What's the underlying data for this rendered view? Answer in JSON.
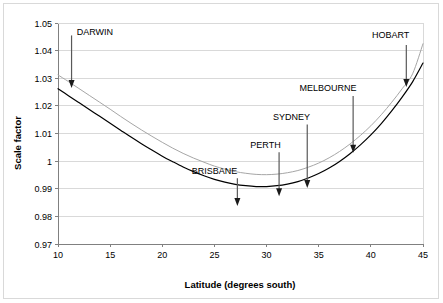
{
  "chart_data": {
    "type": "line",
    "title": "",
    "xlabel": "Latitude (degrees south)",
    "ylabel": "Scale factor",
    "xlim": [
      10,
      45
    ],
    "ylim": [
      0.97,
      1.05
    ],
    "xticks": [
      "10",
      "15",
      "20",
      "25",
      "30",
      "35",
      "40",
      "45"
    ],
    "xtick_values": [
      10,
      15,
      20,
      25,
      30,
      35,
      40,
      45
    ],
    "yticks": [
      "1.05",
      "1.04",
      "1.03",
      "1.02",
      "1.01",
      "1",
      "0.99",
      "0.98",
      "0.97"
    ],
    "ytick_values": [
      1.05,
      1.04,
      1.03,
      1.02,
      1.01,
      1.0,
      0.99,
      0.98,
      0.97
    ],
    "grid": "horizontal",
    "legend": "none",
    "series": [
      {
        "name": "upper-curve",
        "color": "#a6a6a6",
        "x": [
          10,
          11,
          12,
          13,
          14,
          15,
          16,
          17,
          18,
          19,
          20,
          21,
          22,
          23,
          24,
          25,
          26,
          27,
          28,
          29,
          30,
          31,
          32,
          33,
          34,
          35,
          36,
          37,
          38,
          39,
          40,
          41,
          42,
          43,
          44,
          45
        ],
        "values": [
          1.0312,
          1.0288,
          1.0263,
          1.0238,
          1.0213,
          1.0188,
          1.0162,
          1.0137,
          1.0113,
          1.009,
          1.0068,
          1.0047,
          1.0028,
          1.0011,
          0.9996,
          0.9982,
          0.9971,
          0.9962,
          0.9956,
          0.9952,
          0.9951,
          0.9953,
          0.9958,
          0.9966,
          0.9978,
          0.9993,
          1.0012,
          1.0035,
          1.0062,
          1.0093,
          1.0128,
          1.0168,
          1.0213,
          1.0262,
          1.0316,
          1.0425
        ]
      },
      {
        "name": "lower-curve",
        "color": "#000000",
        "x": [
          10,
          11,
          12,
          13,
          14,
          15,
          16,
          17,
          18,
          19,
          20,
          21,
          22,
          23,
          24,
          25,
          26,
          27,
          28,
          29,
          30,
          31,
          32,
          33,
          34,
          35,
          36,
          37,
          38,
          39,
          40,
          41,
          42,
          43,
          44,
          45
        ],
        "values": [
          1.0262,
          1.0237,
          1.0212,
          1.0187,
          1.0162,
          1.0137,
          1.0112,
          1.0087,
          1.0063,
          1.004,
          1.0018,
          0.9998,
          0.9979,
          0.9962,
          0.9947,
          0.9934,
          0.9924,
          0.9916,
          0.9911,
          0.9908,
          0.9908,
          0.9911,
          0.9917,
          0.9926,
          0.9939,
          0.9955,
          0.9975,
          0.9999,
          1.0027,
          1.0059,
          1.0095,
          1.0136,
          1.0182,
          1.0232,
          1.0287,
          1.0355
        ]
      }
    ],
    "annotations": [
      {
        "label": "DARWIN",
        "label_x": 11.8,
        "label_y": 1.0455,
        "label_anchor": "start",
        "arrow_x": 11.3,
        "arrow_top_y": 1.0455,
        "arrow_tip_x": 11.3,
        "arrow_tip_y": 1.0265
      },
      {
        "label": "BRISBANE",
        "label_x": 25.0,
        "label_y": 0.9955,
        "label_anchor": "middle",
        "arrow_x": 27.2,
        "arrow_top_y": 0.9938,
        "arrow_tip_x": 27.2,
        "arrow_tip_y": 0.9838
      },
      {
        "label": "PERTH",
        "label_x": 29.9,
        "label_y": 1.0048,
        "label_anchor": "middle",
        "arrow_x": 31.2,
        "arrow_top_y": 1.0032,
        "arrow_tip_x": 31.2,
        "arrow_tip_y": 0.9873
      },
      {
        "label": "SYDNEY",
        "label_x": 32.4,
        "label_y": 1.015,
        "label_anchor": "middle",
        "arrow_x": 33.9,
        "arrow_top_y": 1.0133,
        "arrow_tip_x": 33.9,
        "arrow_tip_y": 0.9903
      },
      {
        "label": "MELBOURNE",
        "label_x": 35.9,
        "label_y": 1.0253,
        "label_anchor": "middle",
        "arrow_x": 38.3,
        "arrow_top_y": 1.0236,
        "arrow_tip_x": 38.3,
        "arrow_tip_y": 1.003
      },
      {
        "label": "HOBART",
        "label_x": 41.9,
        "label_y": 1.0447,
        "label_anchor": "middle",
        "arrow_x": 43.4,
        "arrow_top_y": 1.042,
        "arrow_tip_x": 43.4,
        "arrow_tip_y": 1.0268
      }
    ]
  },
  "style": {
    "axis_color": "#808080",
    "grid_color": "#d9d9d9",
    "outer_border_color": "#d9d9d9",
    "background": "#ffffff"
  }
}
